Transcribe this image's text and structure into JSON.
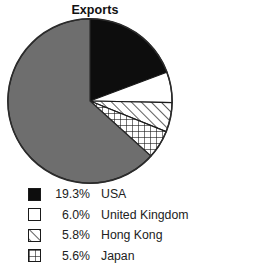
{
  "chart_data": {
    "type": "pie",
    "title": "Exports",
    "xlabel": "",
    "ylabel": "",
    "legend_position": "below",
    "grid": false,
    "units": "percent",
    "start_angle_deg": 90,
    "direction": "clockwise",
    "categories": [
      "USA",
      "United Kingdom",
      "Hong Kong",
      "Japan",
      "Other"
    ],
    "values": [
      19.3,
      6.0,
      5.8,
      5.6,
      63.3
    ],
    "value_labels": [
      "19.3%",
      "6.0%",
      "5.8%",
      "5.6%",
      ""
    ],
    "slices": [
      {
        "label": "USA",
        "value": 19.3,
        "value_label": "19.3%",
        "pattern": "solid",
        "fill": "#0d0d0d",
        "stroke": "#0d0d0d",
        "in_legend": true
      },
      {
        "label": "United Kingdom",
        "value": 6.0,
        "value_label": "6.0%",
        "pattern": "blank",
        "fill": "#ffffff",
        "stroke": "#1a1a1a",
        "in_legend": true
      },
      {
        "label": "Hong Kong",
        "value": 5.8,
        "value_label": "5.8%",
        "pattern": "diagonal-hatch",
        "fill": "#ffffff",
        "stroke": "#1a1a1a",
        "in_legend": true
      },
      {
        "label": "Japan",
        "value": 5.6,
        "value_label": "5.6%",
        "pattern": "grid-crosshatch",
        "fill": "#ffffff",
        "stroke": "#1a1a1a",
        "in_legend": true
      },
      {
        "label": "Other",
        "value": 63.3,
        "value_label": "",
        "pattern": "solid",
        "fill": "#6e6e6e",
        "stroke": "#2b2b2b",
        "in_legend": false
      }
    ]
  },
  "legend": {
    "rows": [
      {
        "percent": "19.3%",
        "label": "USA",
        "swatch": "solid-black-swatch"
      },
      {
        "percent": "6.0%",
        "label": "United Kingdom",
        "swatch": "white-swatch"
      },
      {
        "percent": "5.8%",
        "label": "Hong Kong",
        "swatch": "diagonal-hatch-swatch"
      },
      {
        "percent": "5.6%",
        "label": "Japan",
        "swatch": "grid-crosshatch-swatch"
      }
    ]
  },
  "colors": {
    "black": "#0d0d0d",
    "white": "#ffffff",
    "gray": "#6e6e6e",
    "outline": "#1a1a1a",
    "text": "#222222",
    "background": "#ffffff"
  }
}
